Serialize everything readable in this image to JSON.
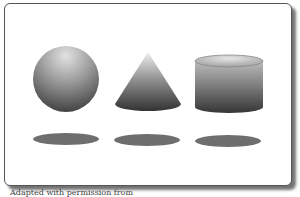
{
  "figure": {
    "shapes": [
      {
        "name": "sphere",
        "label": "Sphere"
      },
      {
        "name": "cone",
        "label": "Cone"
      },
      {
        "name": "cylinder",
        "label": "Cylinder"
      }
    ],
    "shadow_color": "#6e6e6e",
    "caption": "Adapted with permission from"
  }
}
